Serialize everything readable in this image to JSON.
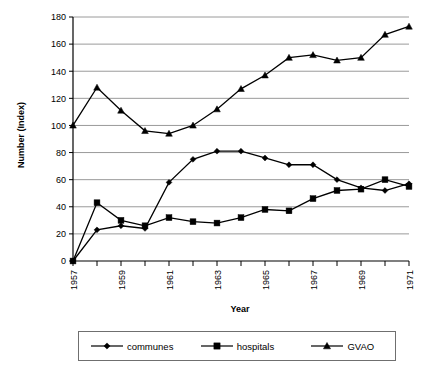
{
  "chart_data": {
    "type": "line",
    "title": "",
    "xlabel": "Year",
    "ylabel": "Number (Index)",
    "x": [
      1957,
      1958,
      1959,
      1960,
      1961,
      1962,
      1963,
      1964,
      1965,
      1966,
      1967,
      1968,
      1969,
      1970,
      1971
    ],
    "xtick_labels": [
      "1957",
      "",
      "1959",
      "",
      "1961",
      "",
      "1963",
      "",
      "1965",
      "",
      "1967",
      "",
      "1969",
      "",
      "1971"
    ],
    "xlim": [
      1957,
      1971
    ],
    "ylim": [
      0,
      180
    ],
    "ytick_labels": [
      "0",
      "20",
      "40",
      "60",
      "80",
      "100",
      "120",
      "140",
      "160",
      "180"
    ],
    "yticks": [
      0,
      20,
      40,
      60,
      80,
      100,
      120,
      140,
      160,
      180
    ],
    "grid": true,
    "legend_position": "bottom",
    "series": [
      {
        "name": "communes",
        "marker": "diamond",
        "color": "#000000",
        "values": [
          0,
          23,
          26,
          24,
          58,
          75,
          81,
          81,
          76,
          71,
          71,
          60,
          54,
          52,
          57
        ]
      },
      {
        "name": "hospitals",
        "marker": "square",
        "color": "#000000",
        "values": [
          0,
          43,
          30,
          26,
          32,
          29,
          28,
          32,
          38,
          37,
          46,
          52,
          53,
          60,
          55
        ]
      },
      {
        "name": "GVAO",
        "marker": "triangle",
        "color": "#000000",
        "values": [
          100,
          128,
          111,
          96,
          94,
          100,
          112,
          127,
          137,
          150,
          152,
          148,
          150,
          167,
          173
        ]
      }
    ]
  },
  "legend": {
    "items": [
      {
        "label": "communes",
        "marker": "diamond"
      },
      {
        "label": "hospitals",
        "marker": "square"
      },
      {
        "label": "GVAO",
        "marker": "triangle"
      }
    ]
  },
  "axes": {
    "x_title": "Year",
    "y_title": "Number (Index)"
  }
}
